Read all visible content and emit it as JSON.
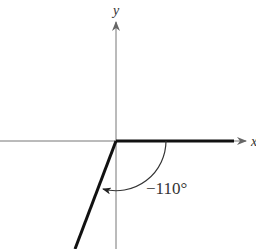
{
  "diagram": {
    "type": "angle-in-standard-position",
    "axes": {
      "x_label": "x",
      "y_label": "y"
    },
    "angle": {
      "label": "−110°",
      "value_degrees": -110,
      "direction": "clockwise"
    },
    "colors": {
      "axis": "#777777",
      "ray": "#111111",
      "arc": "#333333",
      "background": "#ffffff"
    }
  }
}
